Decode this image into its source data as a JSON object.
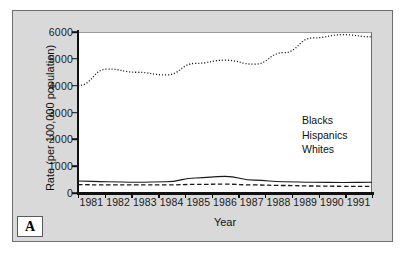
{
  "panel_label": "A",
  "colors": {
    "panel_background": "#d9d9d9",
    "plot_background": "#ffffff",
    "axis": "#111111",
    "series": "#1a1a1a"
  },
  "chart_data": {
    "type": "line",
    "title": "",
    "xlabel": "Year",
    "ylabel": "Rate (per 100,000 population)",
    "x": [
      1981,
      1982,
      1983,
      1984,
      1985,
      1986,
      1987,
      1988,
      1989,
      1990,
      1991
    ],
    "categories": [
      "1981",
      "1982",
      "1983",
      "1984",
      "1985",
      "1986",
      "1987",
      "1988",
      "1989",
      "1990",
      "1991"
    ],
    "xlim": [
      1981,
      1991
    ],
    "ylim": [
      0,
      6000
    ],
    "yticks": [
      0,
      1000,
      2000,
      3000,
      4000,
      5000,
      6000
    ],
    "ytick_labels": [
      "0",
      "1000",
      "2000",
      "3000",
      "4000",
      "5000",
      "6000"
    ],
    "grid": false,
    "legend_position": "center-right",
    "series": [
      {
        "name": "Blacks",
        "style": "dotted",
        "values": [
          4000,
          4620,
          4500,
          4400,
          4830,
          4950,
          4800,
          5230,
          5780,
          5900,
          5820
        ]
      },
      {
        "name": "Hispanics",
        "style": "solid",
        "values": [
          450,
          420,
          400,
          420,
          560,
          620,
          480,
          420,
          400,
          390,
          400
        ]
      },
      {
        "name": "Whites",
        "style": "dashed",
        "values": [
          310,
          300,
          300,
          300,
          320,
          330,
          300,
          280,
          260,
          250,
          250
        ]
      }
    ]
  },
  "legend": {
    "items": [
      {
        "label": "Blacks",
        "style": "dotted"
      },
      {
        "label": "Hispanics",
        "style": "solid"
      },
      {
        "label": "Whites",
        "style": "dashed"
      }
    ]
  }
}
